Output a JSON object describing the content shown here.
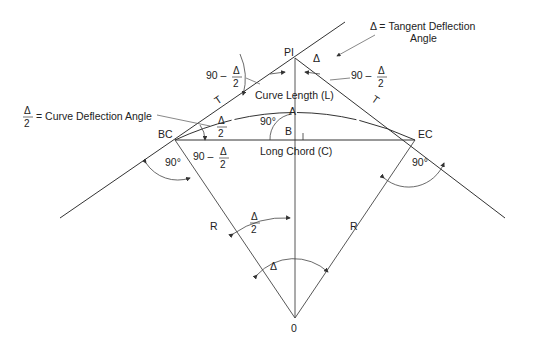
{
  "diagram": {
    "points": {
      "pi": "PI",
      "bc": "BC",
      "ec": "EC",
      "center": "0",
      "a": "A",
      "b": "B"
    },
    "labels": {
      "tangent_left": "T",
      "tangent_right": "T",
      "radius_left": "R",
      "radius_right": "R",
      "curve_length": "Curve Length (L)",
      "long_chord": "Long Chord (C)",
      "right_angle_ab": "90°",
      "right_angle_bc": "90°",
      "right_angle_ec": "90°",
      "delta_pi": "Δ",
      "delta_center": "Δ",
      "ninety_minus": "90 –",
      "delta_sym": "Δ",
      "two": "2"
    },
    "annotations": {
      "tangent_deflection_line1": "Δ = Tangent Deflection",
      "tangent_deflection_line2": "Angle",
      "curve_deflection": "= Curve Deflection Angle"
    },
    "colors": {
      "line": "#333333",
      "background": "#ffffff"
    }
  }
}
